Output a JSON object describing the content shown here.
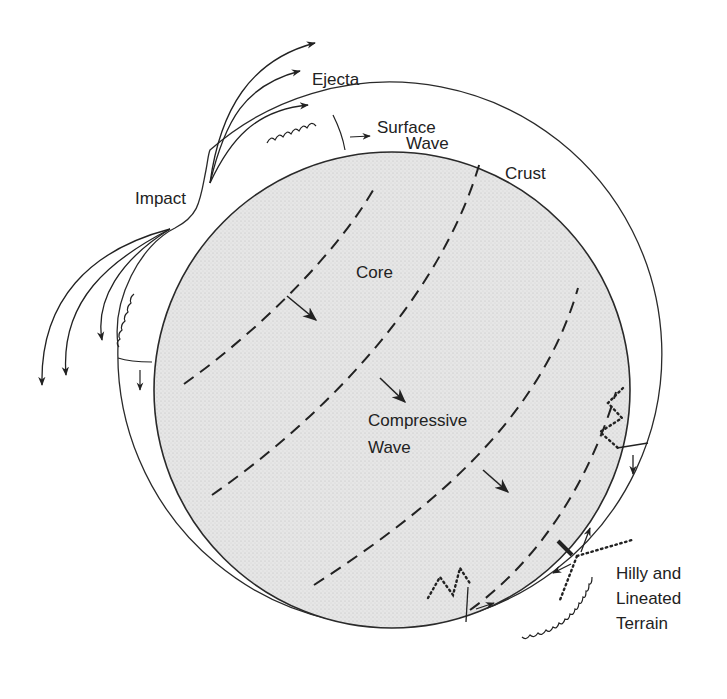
{
  "diagram": {
    "colors": {
      "core_fill": "#e4e4e4",
      "line": "#2a2a2a",
      "background": "#ffffff"
    },
    "labels": {
      "ejecta": "Ejecta",
      "surface_wave_1": "Surface",
      "surface_wave_2": "Wave",
      "crust": "Crust",
      "impact": "Impact",
      "core": "Core",
      "compressive_1": "Compressive",
      "compressive_2": "Wave",
      "terrain_1": "Hilly and",
      "terrain_2": "Lineated",
      "terrain_3": "Terrain"
    },
    "components": [
      {
        "name": "crust",
        "shape": "outer ring"
      },
      {
        "name": "core",
        "shape": "stippled inner circle"
      },
      {
        "name": "compressive-wave-fronts",
        "count": 4,
        "style": "dashed arcs"
      },
      {
        "name": "ejecta-trajectories",
        "count": 6,
        "style": "curved arrows"
      },
      {
        "name": "surface-waves",
        "count": 2,
        "style": "scalloped crust segments"
      },
      {
        "name": "antipodal-focus",
        "style": "dotted reflected rays"
      }
    ]
  }
}
